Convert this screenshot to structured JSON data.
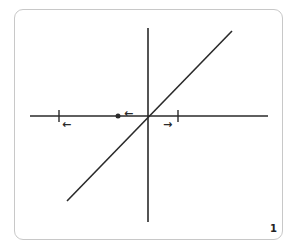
{
  "diagram": {
    "title": "",
    "page_number": "1",
    "colors": {
      "stroke": "#2a2a2a",
      "frame": "#c8c8c8",
      "background": "#ffffff"
    },
    "axes": {
      "horizontal": {
        "x1": 30,
        "x2": 268,
        "y": 116
      },
      "vertical": {
        "x": 148,
        "y1": 28,
        "y2": 222
      }
    },
    "line": {
      "x1": 67,
      "y1": 201,
      "x2": 232,
      "y2": 31,
      "description": "diagonal line through origin"
    },
    "ticks": [
      {
        "x": 59,
        "y": 116,
        "label": "left tick"
      },
      {
        "x": 178,
        "y": 116,
        "label": "right tick"
      }
    ],
    "point": {
      "x": 118,
      "y": 116,
      "label": "dot on horizontal axis"
    },
    "arrows": [
      {
        "glyph": "←",
        "x": 62,
        "y": 124,
        "direction": "left"
      },
      {
        "glyph": "←",
        "x": 124,
        "y": 113,
        "direction": "left"
      },
      {
        "glyph": "→",
        "x": 163,
        "y": 124,
        "direction": "right"
      }
    ]
  }
}
